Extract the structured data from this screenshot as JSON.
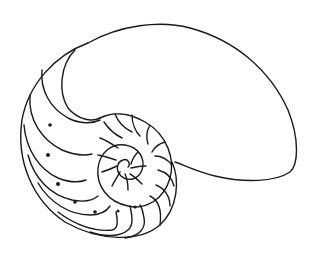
{
  "image": {
    "subject": "Nautilus shell line drawing",
    "style": "black ink outline on white background",
    "colors": {
      "stroke": "#1a1a1a",
      "background": "#ffffff"
    },
    "chambers_visible": 24
  }
}
